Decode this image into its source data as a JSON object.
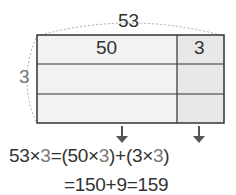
{
  "diagram": {
    "total_width_label": "53",
    "part_a_label": "50",
    "part_b_label": "3",
    "height_label": "3",
    "rows": 3,
    "colors": {
      "part_a_fill": "#f2f2f2",
      "part_b_fill": "#e8e8e8",
      "stroke": "#333333",
      "dashed": "#aaaaaa"
    }
  },
  "equation": {
    "line1": {
      "lhs": "53",
      "times1": "×",
      "lhs_b": "3",
      "eq": "=",
      "open1": "(",
      "a": "50",
      "times2": "×",
      "a_b": "3",
      "close1": ")",
      "plus": "+",
      "open2": "(",
      "b": "3",
      "times3": "×",
      "b_b": "3",
      "close2": ")"
    },
    "line2": "=150+9=159"
  }
}
